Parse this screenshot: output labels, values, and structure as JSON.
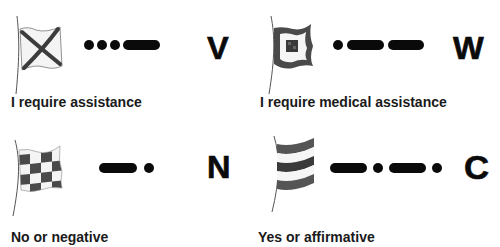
{
  "figure": {
    "signals": [
      {
        "letter": "V",
        "flag_icon": "flag-v-saltire-icon",
        "morse": [
          "dot",
          "dot",
          "dot",
          "dash"
        ],
        "morse_text": "···—",
        "caption": "I require assistance"
      },
      {
        "letter": "W",
        "flag_icon": "flag-w-concentric-squares-icon",
        "morse": [
          "dot",
          "dash",
          "dash"
        ],
        "morse_text": "·——",
        "caption": "I require medical assistance"
      },
      {
        "letter": "N",
        "flag_icon": "flag-n-checkered-icon",
        "morse": [
          "dash",
          "dot"
        ],
        "morse_text": "—·",
        "caption": "No or negative"
      },
      {
        "letter": "C",
        "flag_icon": "flag-c-horizontal-stripes-icon",
        "morse": [
          "dash",
          "dot",
          "dash",
          "dot"
        ],
        "morse_text": "—·—·",
        "caption": "Yes or affirmative"
      }
    ],
    "colors": {
      "ink": "#0a0a0a",
      "flag_dark": "#4a4a4a",
      "flag_light": "#f2f2f2",
      "pole": "#555555",
      "background": "#ffffff"
    }
  }
}
